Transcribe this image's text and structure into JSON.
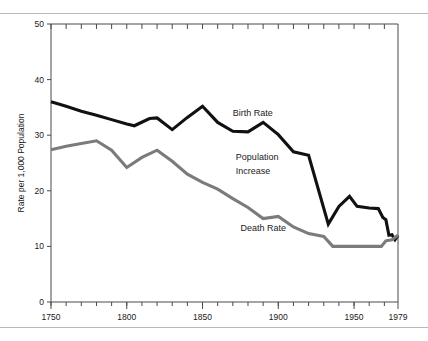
{
  "chart_data": {
    "type": "line",
    "title": "",
    "xlabel": "",
    "ylabel": "Rate per 1,000 Population",
    "xlim": [
      1750,
      1979
    ],
    "ylim": [
      0,
      50
    ],
    "grid": false,
    "legend_position": "inline-annotations",
    "x_ticks": [
      {
        "value": 1750,
        "label": "1750"
      },
      {
        "value": 1800,
        "label": "1800"
      },
      {
        "value": 1850,
        "label": "1850"
      },
      {
        "value": 1900,
        "label": "1900"
      },
      {
        "value": 1950,
        "label": "1950"
      },
      {
        "value": 1979,
        "label": "1979"
      }
    ],
    "x_minor_tick_interval": 10,
    "y_ticks": [
      {
        "value": 0,
        "label": "0"
      },
      {
        "value": 10,
        "label": "10"
      },
      {
        "value": 20,
        "label": "20"
      },
      {
        "value": 30,
        "label": "30"
      },
      {
        "value": 40,
        "label": "40"
      },
      {
        "value": 50,
        "label": "50"
      }
    ],
    "annotations": [
      {
        "text": "Birth Rate",
        "x": 1870,
        "y": 33.5
      },
      {
        "text": "Population",
        "x": 1872,
        "y": 25.5
      },
      {
        "text": "Increase",
        "x": 1872,
        "y": 23.0
      },
      {
        "text": "Death Rate",
        "x": 1875,
        "y": 12.8
      }
    ],
    "series": [
      {
        "name": "Birth Rate",
        "color": "#111111",
        "points": [
          [
            1750,
            36.0
          ],
          [
            1760,
            35.2
          ],
          [
            1770,
            34.3
          ],
          [
            1780,
            33.6
          ],
          [
            1790,
            32.8
          ],
          [
            1800,
            32.0
          ],
          [
            1805,
            31.7
          ],
          [
            1815,
            33.0
          ],
          [
            1820,
            33.1
          ],
          [
            1830,
            31.0
          ],
          [
            1840,
            33.2
          ],
          [
            1850,
            35.2
          ],
          [
            1860,
            32.3
          ],
          [
            1870,
            30.7
          ],
          [
            1880,
            30.6
          ],
          [
            1890,
            32.3
          ],
          [
            1900,
            30.1
          ],
          [
            1910,
            27.0
          ],
          [
            1920,
            26.4
          ],
          [
            1933,
            14.0
          ],
          [
            1940,
            17.2
          ],
          [
            1947,
            19.0
          ],
          [
            1952,
            17.2
          ],
          [
            1960,
            16.9
          ],
          [
            1966,
            16.8
          ],
          [
            1969,
            15.2
          ],
          [
            1971,
            14.8
          ],
          [
            1973,
            12.0
          ],
          [
            1975,
            12.1
          ],
          [
            1977,
            11.2
          ],
          [
            1979,
            12.0
          ]
        ]
      },
      {
        "name": "Death Rate",
        "color": "#7b7b7b",
        "points": [
          [
            1750,
            27.4
          ],
          [
            1760,
            28.0
          ],
          [
            1770,
            28.5
          ],
          [
            1780,
            29.0
          ],
          [
            1790,
            27.3
          ],
          [
            1800,
            24.2
          ],
          [
            1810,
            26.0
          ],
          [
            1820,
            27.3
          ],
          [
            1830,
            25.3
          ],
          [
            1840,
            23.0
          ],
          [
            1850,
            21.5
          ],
          [
            1860,
            20.3
          ],
          [
            1870,
            18.6
          ],
          [
            1880,
            17.0
          ],
          [
            1890,
            15.0
          ],
          [
            1900,
            15.4
          ],
          [
            1910,
            13.5
          ],
          [
            1920,
            12.3
          ],
          [
            1930,
            11.8
          ],
          [
            1936,
            10.0
          ],
          [
            1950,
            10.0
          ],
          [
            1960,
            10.0
          ],
          [
            1968,
            10.0
          ],
          [
            1971,
            11.0
          ],
          [
            1975,
            11.2
          ],
          [
            1979,
            12.0
          ]
        ]
      }
    ]
  }
}
